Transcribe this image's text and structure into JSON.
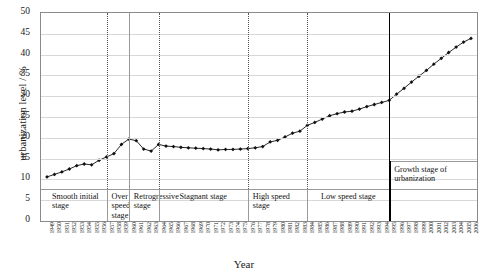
{
  "chart_data": {
    "type": "line",
    "title": "",
    "xlabel": "Year",
    "ylabel": "urbanization level / %",
    "ylim": [
      0,
      50
    ],
    "ytick_step": 5,
    "yticks": [
      0,
      5,
      10,
      15,
      20,
      25,
      30,
      35,
      40,
      45,
      50
    ],
    "grid": true,
    "legend": "none",
    "marker": "diamond",
    "line_color": "#111111",
    "x": [
      1949,
      1950,
      1951,
      1952,
      1953,
      1954,
      1955,
      1956,
      1957,
      1958,
      1959,
      1960,
      1961,
      1962,
      1963,
      1964,
      1965,
      1966,
      1967,
      1968,
      1969,
      1970,
      1971,
      1972,
      1973,
      1974,
      1975,
      1976,
      1977,
      1978,
      1979,
      1980,
      1981,
      1982,
      1983,
      1984,
      1985,
      1986,
      1987,
      1988,
      1989,
      1990,
      1991,
      1992,
      1993,
      1994,
      1995,
      1996,
      1997,
      1998,
      1999,
      2000,
      2001,
      2002,
      2003,
      2004,
      2005,
      2006
    ],
    "categories": [
      "1949",
      "1950",
      "1951",
      "1952",
      "1953",
      "1954",
      "1955",
      "1956",
      "1957",
      "1958",
      "1959",
      "1960",
      "1961",
      "1962",
      "1963",
      "1964",
      "1965",
      "1966",
      "1967",
      "1968",
      "1969",
      "1970",
      "1971",
      "1972",
      "1973",
      "1974",
      "1975",
      "1976",
      "1977",
      "1978",
      "1979",
      "1980",
      "1981",
      "1982",
      "1983",
      "1984",
      "1985",
      "1986",
      "1987",
      "1988",
      "1989",
      "1990",
      "1991",
      "1992",
      "1993",
      "1994",
      "1995",
      "1996",
      "1997",
      "1998",
      "1999",
      "2000",
      "2001",
      "2002",
      "2003",
      "2004",
      "2005",
      "2006"
    ],
    "values": [
      10.6,
      11.2,
      11.8,
      12.5,
      13.3,
      13.7,
      13.5,
      14.6,
      15.4,
      16.2,
      18.4,
      19.7,
      19.3,
      17.3,
      16.8,
      18.4,
      18.0,
      17.9,
      17.7,
      17.6,
      17.5,
      17.4,
      17.3,
      17.1,
      17.2,
      17.2,
      17.3,
      17.4,
      17.6,
      17.9,
      19.0,
      19.4,
      20.2,
      21.1,
      21.6,
      23.0,
      23.7,
      24.5,
      25.3,
      25.8,
      26.2,
      26.4,
      26.9,
      27.5,
      28.0,
      28.5,
      29.0,
      30.5,
      31.9,
      33.4,
      34.8,
      36.2,
      37.7,
      39.1,
      40.5,
      41.8,
      43.0,
      43.9
    ],
    "stages": [
      {
        "label": "Smooth initial stage",
        "start_year": 1949,
        "end_year": 1957
      },
      {
        "label": "Over speed stage",
        "start_year": 1957,
        "end_year": 1960
      },
      {
        "label": "Retrogressive stage",
        "start_year": 1960,
        "end_year": 1964
      },
      {
        "label": "Stagnant stage",
        "start_year": 1964,
        "end_year": 1976
      },
      {
        "label": "High speed stage",
        "start_year": 1976,
        "end_year": 1984
      },
      {
        "label": "Low speed stage",
        "start_year": 1984,
        "end_year": 1995
      },
      {
        "label": "Growth stage of urbanization",
        "start_year": 1995,
        "end_year": 2006
      }
    ]
  },
  "axes": {
    "ylabel": "urbanization level / %",
    "xlabel": "Year",
    "ytick_labels": [
      "50",
      "45",
      "40",
      "35",
      "30",
      "25",
      "20",
      "15",
      "10",
      "5",
      "0"
    ]
  },
  "stage_labels": {
    "smooth_initial": "Smooth initial stage",
    "over_speed": "Over speed stage",
    "retrogressive": "Retrogressive stage",
    "stagnant": "Stagnant stage",
    "high_speed": "High speed stage",
    "low_speed": "Low speed stage",
    "growth": "Growth stage of urbanization"
  }
}
